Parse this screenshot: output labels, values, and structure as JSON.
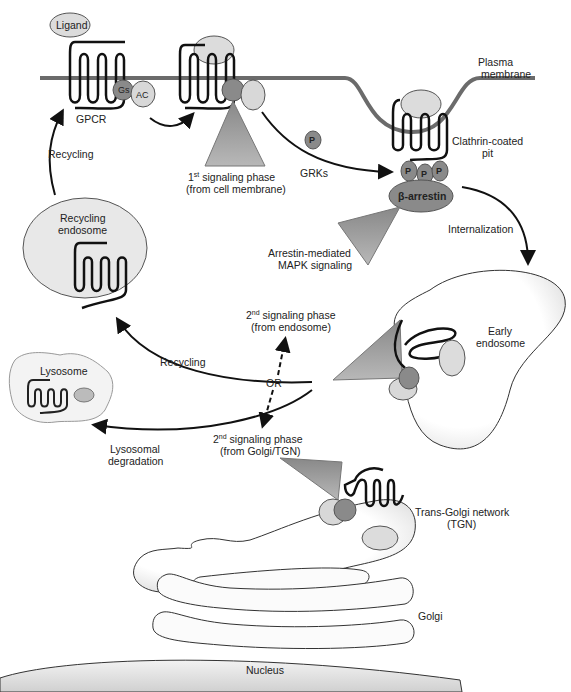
{
  "diagram": {
    "labels": {
      "ligand": "Ligand",
      "plasma_membrane_1": "Plasma",
      "plasma_membrane_2": "membrane",
      "gs": "Gs",
      "ac": "AC",
      "gpcr": "GPCR",
      "recycling_top": "Recycling",
      "first_phase_num": "1",
      "first_phase_sup": "st",
      "first_phase_1": " signaling phase",
      "first_phase_2": "(from cell membrane)",
      "p_free": "P",
      "grks": "GRKs",
      "clathrin_1": "Clathrin-coated",
      "clathrin_2": "pit",
      "p1": "P",
      "p2": "P",
      "p3": "P",
      "beta_arrestin": "β-arrestin",
      "internalization": "Internalization",
      "arrestin_mapk_1": "Arrestin-mediated",
      "arrestin_mapk_2": "MAPK signaling",
      "recycling_endosome_1": "Recycling",
      "recycling_endosome_2": "endosome",
      "second_endo_num": "2",
      "second_endo_sup": "nd",
      "second_endo_1": " signaling phase",
      "second_endo_2": "(from endosome)",
      "early_endosome_1": "Early",
      "early_endosome_2": "endosome",
      "recycling_mid": "Recycling",
      "or": "OR",
      "lysosome": "Lysosome",
      "second_golgi_num": "2",
      "second_golgi_sup": "nd",
      "second_golgi_1": " signaling phase",
      "second_golgi_2": "(from Golgi/TGN)",
      "lysosomal_1": "Lysosomal",
      "lysosomal_2": "degradation",
      "tgn_1": "Trans-Golgi network",
      "tgn_2": "(TGN)",
      "golgi": "Golgi",
      "nucleus": "Nucleus"
    },
    "colors": {
      "membrane": "#6b6b6b",
      "dark_protein": "#8a8a8a",
      "light_protein": "#d8d8d8",
      "triangle": "#9a9a9a",
      "line": "#111111"
    }
  }
}
